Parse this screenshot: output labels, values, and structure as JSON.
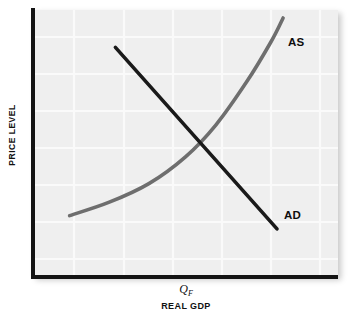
{
  "figure": {
    "background_color": "#ffffff",
    "panel_color": "#efefef",
    "gridline_color": "#fafafa",
    "axis_color": "#141414"
  },
  "axes": {
    "y_title": "PRICE LEVEL",
    "x_title": "REAL GDP",
    "x_tick_symbol": "Q",
    "x_tick_subscript": "F"
  },
  "labels": {
    "as": "AS",
    "ad": "AD"
  },
  "chart_data": {
    "type": "line",
    "title": "",
    "subtitle": "",
    "xlabel": "REAL GDP",
    "ylabel": "PRICE LEVEL",
    "xlim": [
      0,
      100
    ],
    "ylim": [
      0,
      100
    ],
    "grid": true,
    "legend_position": "inline-curve-labels",
    "annotations": [
      {
        "text": "AS",
        "x": 82,
        "y": 88,
        "description": "Aggregate supply curve label at top-right end of upward-sloping curve"
      },
      {
        "text": "AD",
        "x": 82,
        "y": 23,
        "description": "Aggregate demand curve label at lower-right end of downward-sloping line"
      },
      {
        "text": "Q_F",
        "x": 50,
        "y": 0,
        "description": "Full-employment real GDP tick mark on horizontal axis"
      }
    ],
    "series": [
      {
        "name": "AD",
        "label": "AD",
        "color": "#1a1a1a",
        "linewidth": 3.6,
        "shape": "straight-downward-sloping",
        "points": [
          {
            "x": 27,
            "y": 86
          },
          {
            "x": 40,
            "y": 72
          },
          {
            "x": 53,
            "y": 58
          },
          {
            "x": 62,
            "y": 43
          },
          {
            "x": 72,
            "y": 29
          },
          {
            "x": 80,
            "y": 18
          }
        ]
      },
      {
        "name": "AS",
        "label": "AS",
        "color": "#6e6e6e",
        "linewidth": 3.6,
        "shape": "upward-sloping-convex",
        "points": [
          {
            "x": 12,
            "y": 23
          },
          {
            "x": 25,
            "y": 28
          },
          {
            "x": 38,
            "y": 35
          },
          {
            "x": 50,
            "y": 45
          },
          {
            "x": 60,
            "y": 57
          },
          {
            "x": 70,
            "y": 73
          },
          {
            "x": 78,
            "y": 88
          },
          {
            "x": 82,
            "y": 97
          }
        ]
      }
    ],
    "intersection": {
      "x": 62,
      "y": 42,
      "description": "Equilibrium where AD crosses AS, to the right of Q_F"
    }
  }
}
